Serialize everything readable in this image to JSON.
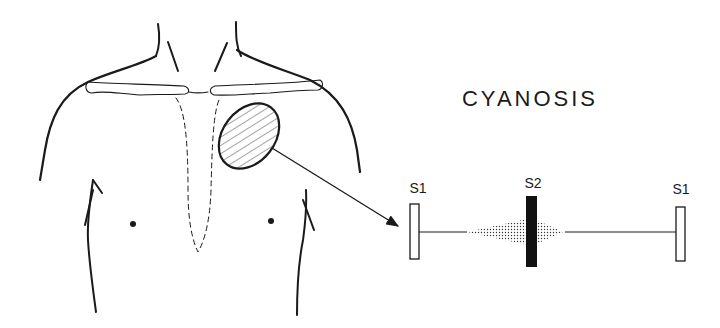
{
  "title": "CYANOSIS",
  "phonocardiogram": {
    "labels": {
      "s1_left": "S1",
      "s2": "S2",
      "s1_right": "S1"
    },
    "components": [
      {
        "name": "S1",
        "style": "open-rectangle"
      },
      {
        "name": "murmur",
        "style": "stippled-diamond",
        "centered_on": "S2"
      },
      {
        "name": "S2",
        "style": "solid-black-bar"
      },
      {
        "name": "S1",
        "style": "open-rectangle"
      }
    ]
  },
  "figure": {
    "highlighted_area": "hatched oval, left upper chest (pulmonic area)",
    "arrow": "from hatched area to phonocardiogram",
    "colors": {
      "ink": "#1a1a1a",
      "background": "#ffffff"
    }
  }
}
